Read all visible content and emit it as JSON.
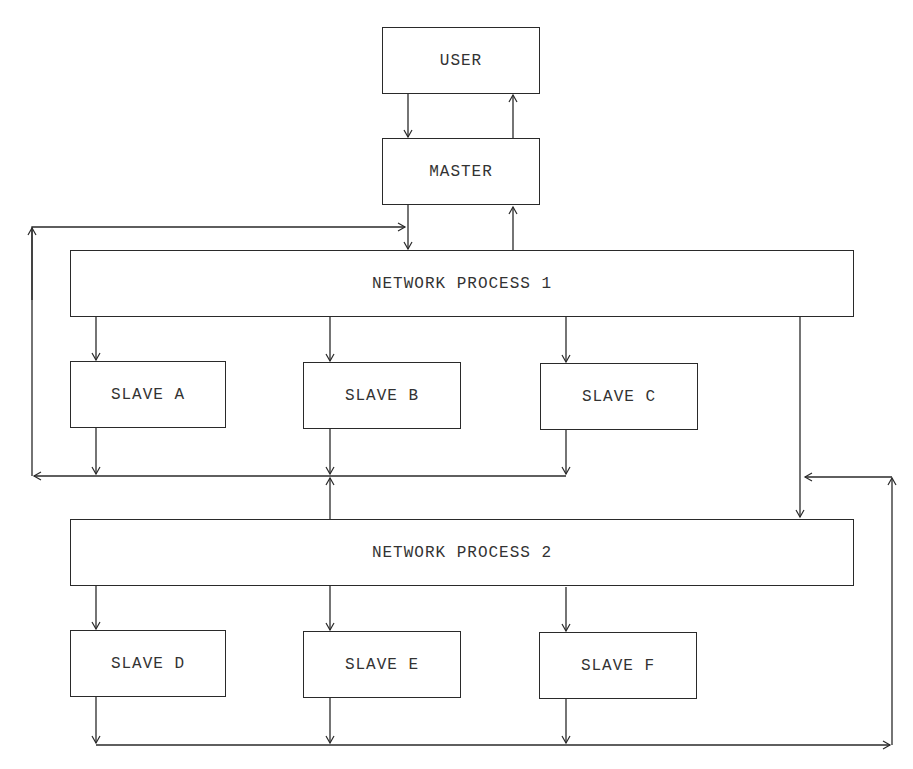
{
  "diagram": {
    "type": "block-diagram",
    "nodes": {
      "user": {
        "label": "USER"
      },
      "master": {
        "label": "MASTER"
      },
      "network_process_1": {
        "label": "NETWORK PROCESS 1"
      },
      "slave_a": {
        "label": "SLAVE A"
      },
      "slave_b": {
        "label": "SLAVE B"
      },
      "slave_c": {
        "label": "SLAVE C"
      },
      "network_process_2": {
        "label": "NETWORK PROCESS 2"
      },
      "slave_d": {
        "label": "SLAVE D"
      },
      "slave_e": {
        "label": "SLAVE E"
      },
      "slave_f": {
        "label": "SLAVE F"
      }
    },
    "edges": [
      {
        "from": "USER",
        "to": "MASTER"
      },
      {
        "from": "MASTER",
        "to": "USER"
      },
      {
        "from": "MASTER",
        "to": "NETWORK PROCESS 1"
      },
      {
        "from": "NETWORK PROCESS 1",
        "to": "MASTER"
      },
      {
        "from": "NETWORK PROCESS 1",
        "to": "SLAVE A"
      },
      {
        "from": "NETWORK PROCESS 1",
        "to": "SLAVE B"
      },
      {
        "from": "NETWORK PROCESS 1",
        "to": "SLAVE C"
      },
      {
        "from": "NETWORK PROCESS 1",
        "to": "NETWORK PROCESS 2"
      },
      {
        "from": "SLAVE A",
        "to": "bus-1"
      },
      {
        "from": "SLAVE B",
        "to": "bus-1"
      },
      {
        "from": "SLAVE C",
        "to": "bus-1"
      },
      {
        "from": "NETWORK PROCESS 2",
        "to": "bus-1"
      },
      {
        "from": "bus-1",
        "to": "NETWORK PROCESS 1",
        "via": "left feedback loop"
      },
      {
        "from": "NETWORK PROCESS 2",
        "to": "SLAVE D"
      },
      {
        "from": "NETWORK PROCESS 2",
        "to": "SLAVE E"
      },
      {
        "from": "NETWORK PROCESS 2",
        "to": "SLAVE F"
      },
      {
        "from": "SLAVE D",
        "to": "bus-2"
      },
      {
        "from": "SLAVE E",
        "to": "bus-2"
      },
      {
        "from": "SLAVE F",
        "to": "bus-2"
      },
      {
        "from": "bus-2",
        "to": "NETWORK PROCESS 2",
        "via": "right feedback loop"
      }
    ]
  },
  "colors": {
    "line": "#2a2a2a",
    "text": "#333333",
    "background": "#ffffff"
  }
}
